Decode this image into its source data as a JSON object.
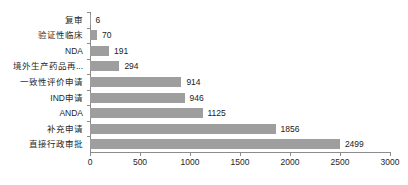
{
  "chart_data": {
    "type": "bar",
    "orientation": "horizontal",
    "title": "",
    "subtitle": "",
    "xlabel": "",
    "ylabel": "",
    "xlim": [
      0,
      3000
    ],
    "xticks": [
      0,
      500,
      1000,
      1500,
      2000,
      2500,
      3000
    ],
    "xtick_labels": [
      "0",
      "500",
      "1000",
      "1500",
      "2000",
      "2500",
      "3000"
    ],
    "grid": false,
    "legend": false,
    "bar_color": "#9e9e9e",
    "axis_color": "#8c8c8c",
    "label_color": "#262626",
    "categories": [
      "复审",
      "验证性临床",
      "NDA",
      "境外生产药品再...",
      "一致性评价申请",
      "IND申请",
      "ANDA",
      "补充申请",
      "直接行政审批"
    ],
    "values": [
      6,
      70,
      191,
      294,
      914,
      946,
      1125,
      1856,
      2499
    ],
    "value_labels": [
      "6",
      "70",
      "191",
      "294",
      "914",
      "946",
      "1125",
      "1856",
      "2499"
    ]
  }
}
